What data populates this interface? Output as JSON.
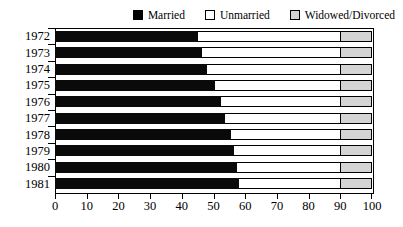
{
  "chart_data": {
    "type": "bar",
    "orientation": "horizontal",
    "stacked": true,
    "title": "",
    "subtitle": "",
    "xlabel": "",
    "ylabel": "",
    "xlim": [
      0,
      100
    ],
    "xticks": [
      0,
      10,
      20,
      30,
      40,
      50,
      60,
      70,
      80,
      90,
      100
    ],
    "xtick_labels": [
      "0",
      "10",
      "20",
      "30",
      "40",
      "50",
      "60",
      "70",
      "80",
      "90",
      "100"
    ],
    "grid": false,
    "legend_position": "top-right",
    "categories": [
      "1972",
      "1973",
      "1974",
      "1975",
      "1976",
      "1977",
      "1978",
      "1979",
      "1980",
      "1981"
    ],
    "series": [
      {
        "name": "Married",
        "color": "#000000",
        "values": [
          45,
          46.5,
          48,
          50.5,
          52.5,
          53.5,
          55.5,
          56.5,
          57.5,
          58
        ]
      },
      {
        "name": "Unmarried",
        "color": "#ffffff",
        "values": [
          45,
          43.5,
          42,
          39.5,
          37.5,
          36.5,
          34.5,
          33.5,
          32.5,
          32
        ]
      },
      {
        "name": "Widowed/Divorced",
        "color": "#d4d4d4",
        "values": [
          10,
          10,
          10,
          10,
          10,
          10,
          10,
          10,
          10,
          10
        ]
      }
    ]
  },
  "legend": {
    "entries": [
      {
        "label": "Married",
        "swatch": "black-swatch-icon"
      },
      {
        "label": "Unmarried",
        "swatch": "white-swatch-icon"
      },
      {
        "label": "Widowed/Divorced",
        "swatch": "gray-swatch-icon"
      }
    ]
  },
  "colors": {
    "married": "#000000",
    "unmarried": "#ffffff",
    "widowed": "#d4d4d4",
    "axis": "#000000",
    "background": "#ffffff"
  }
}
